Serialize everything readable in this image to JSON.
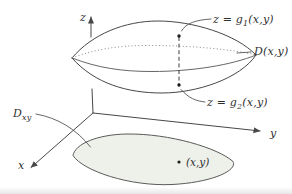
{
  "axes": {
    "x_label": "x",
    "y_label": "y",
    "z_label": "z"
  },
  "labels": {
    "upper_surface_prefix": "z = g",
    "upper_surface_sub": "1",
    "upper_surface_suffix": "(x,y)",
    "lower_surface_prefix": "z = g",
    "lower_surface_sub": "2",
    "lower_surface_suffix": "(x,y)",
    "column_region": "D(x,y)",
    "projection_base": "D",
    "projection_sub": "xy",
    "point": "(x,y)"
  },
  "colors": {
    "line": "#474747",
    "dotted_line": "#7a7a7a",
    "region_fill": "#eef0ea",
    "text": "#2f2f2f"
  }
}
